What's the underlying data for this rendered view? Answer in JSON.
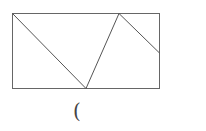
{
  "figure": {
    "rectangle": {
      "x": 12,
      "y": 13,
      "width": 147,
      "height": 75
    },
    "segments": [
      {
        "x1": 12,
        "y1": 13,
        "x2": 86,
        "y2": 88
      },
      {
        "x1": 86,
        "y1": 88,
        "x2": 119,
        "y2": 13
      },
      {
        "x1": 119,
        "y1": 13,
        "x2": 159,
        "y2": 53
      }
    ],
    "stroke_color": "#555555",
    "caption": "("
  }
}
